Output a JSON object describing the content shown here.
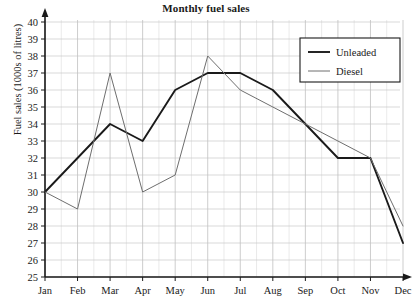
{
  "chart_data": {
    "type": "line",
    "title": "Monthly fuel sales",
    "xlabel": "",
    "ylabel": "Fuel sales (1000s of litres)",
    "categories": [
      "Jan",
      "Feb",
      "Mar",
      "Apr",
      "May",
      "Jun",
      "Jul",
      "Aug",
      "Sep",
      "Oct",
      "Nov",
      "Dec"
    ],
    "ylim": [
      25,
      40
    ],
    "ytick_labels": [
      "25",
      "26",
      "27",
      "28",
      "29",
      "30",
      "31",
      "32",
      "33",
      "34",
      "35",
      "36",
      "37",
      "38",
      "39",
      "40"
    ],
    "grid": true,
    "legend_position": "top-right",
    "series": [
      {
        "name": "Unleaded",
        "color": "#1a1a1a",
        "width": 1.9,
        "values": [
          30,
          32,
          34,
          33,
          36,
          37,
          37,
          36,
          34,
          32,
          32,
          27
        ]
      },
      {
        "name": "Diesel",
        "color": "#6e6e6e",
        "width": 1.0,
        "values": [
          30,
          29,
          37,
          30,
          31,
          38,
          36,
          35,
          34,
          33,
          32,
          28
        ]
      }
    ]
  },
  "axes": {
    "y_min": 25,
    "y_max": 40,
    "minor_x_divisions": 2
  }
}
